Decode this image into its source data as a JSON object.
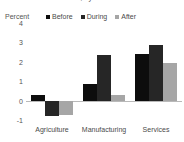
{
  "chart_data": {
    "type": "bar",
    "title": "Growth in Value Added, by Sector",
    "subtitle": "",
    "xlabel": "",
    "ylabel": "Percent",
    "ylim": [
      -1,
      4
    ],
    "yticks": [
      4,
      3,
      2,
      1,
      0,
      -1
    ],
    "ytick_labels": [
      "4",
      "3",
      "2",
      "1",
      "0",
      "-1"
    ],
    "grid": false,
    "legend_position": "top",
    "zero_line": 0,
    "categories": [
      "Agriculture",
      "Manufacturing",
      "Services"
    ],
    "series": [
      {
        "name": "Before",
        "color": "#0d0d0d",
        "values": [
          0.3,
          0.85,
          2.4
        ]
      },
      {
        "name": "During",
        "color": "#262626",
        "values": [
          -0.8,
          2.35,
          2.85
        ]
      },
      {
        "name": "After",
        "color": "#a6a6a6",
        "values": [
          -0.75,
          0.3,
          1.95
        ]
      }
    ]
  },
  "axis": {
    "unit_label": "Percent"
  }
}
